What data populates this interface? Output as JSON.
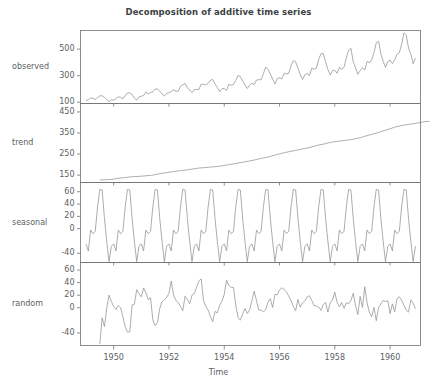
{
  "title": "Decomposition of additive time series",
  "xaxis": {
    "label": "Time",
    "ticks": [
      1950,
      1952,
      1954,
      1956,
      1958,
      1960
    ],
    "range": [
      1948.8,
      1961.1
    ]
  },
  "panels": [
    {
      "name": "observed",
      "label": "observed",
      "yticks": [
        100,
        300,
        500
      ],
      "ylim": [
        90,
        640
      ]
    },
    {
      "name": "trend",
      "label": "trend",
      "yticks": [
        150,
        250,
        350,
        450
      ],
      "ylim": [
        115,
        490
      ]
    },
    {
      "name": "seasonal",
      "label": "seasonal",
      "yticks": [
        -40,
        0,
        20,
        40,
        60
      ],
      "ylim": [
        -55,
        75
      ]
    },
    {
      "name": "random",
      "label": "random",
      "yticks": [
        -40,
        0,
        20,
        40,
        60
      ],
      "ylim": [
        -60,
        72
      ]
    }
  ],
  "chart_data": {
    "type": "line",
    "title": "Decomposition of additive time series",
    "xlabel": "Time",
    "ylabel": "",
    "grid": false,
    "legend": "none",
    "x_start": 1949.0,
    "x_step": 0.0833333,
    "xlim": [
      1948.8,
      1961.1
    ],
    "series": [
      {
        "name": "observed",
        "ylim": [
          90,
          640
        ],
        "yticks": [
          100,
          300,
          500
        ],
        "values": [
          112,
          118,
          132,
          129,
          121,
          135,
          148,
          148,
          136,
          119,
          104,
          118,
          115,
          126,
          141,
          135,
          125,
          149,
          170,
          170,
          158,
          133,
          114,
          140,
          145,
          150,
          178,
          163,
          172,
          178,
          199,
          199,
          184,
          162,
          146,
          166,
          171,
          180,
          193,
          181,
          183,
          218,
          230,
          242,
          209,
          191,
          172,
          194,
          196,
          196,
          236,
          235,
          229,
          243,
          264,
          272,
          237,
          211,
          180,
          201,
          204,
          188,
          235,
          227,
          234,
          264,
          302,
          293,
          259,
          229,
          203,
          229,
          242,
          233,
          267,
          269,
          270,
          315,
          364,
          347,
          312,
          274,
          237,
          278,
          284,
          277,
          317,
          313,
          318,
          374,
          413,
          405,
          355,
          306,
          271,
          306,
          315,
          301,
          356,
          348,
          355,
          422,
          465,
          467,
          404,
          347,
          305,
          336,
          340,
          318,
          362,
          348,
          363,
          435,
          491,
          505,
          404,
          359,
          310,
          337,
          360,
          342,
          406,
          396,
          420,
          472,
          548,
          559,
          463,
          407,
          362,
          405,
          417,
          391,
          419,
          461,
          472,
          535,
          622,
          606,
          508,
          461,
          390,
          432
        ]
      },
      {
        "name": "trend",
        "ylim": [
          115,
          490
        ],
        "yticks": [
          150,
          250,
          350,
          450
        ],
        "x_offset_months": 6,
        "values": [
          126.79,
          127.25,
          127.96,
          128.58,
          129.0,
          129.75,
          131.25,
          133.08,
          134.92,
          136.42,
          137.42,
          138.54,
          139.79,
          141.13,
          142.33,
          143.08,
          143.63,
          144.13,
          145.08,
          145.83,
          146.96,
          148.0,
          148.92,
          150.21,
          152.38,
          154.67,
          156.58,
          158.33,
          160.17,
          161.92,
          163.58,
          165.42,
          167.17,
          168.5,
          169.83,
          171.25,
          172.79,
          173.71,
          175.04,
          176.92,
          178.54,
          180.17,
          182.08,
          183.46,
          184.54,
          185.25,
          186.29,
          187.21,
          188.21,
          189.04,
          190.17,
          191.29,
          192.54,
          194.17,
          196.04,
          197.75,
          199.42,
          201.42,
          203.5,
          205.54,
          207.46,
          209.29,
          211.0,
          213.04,
          215.21,
          217.29,
          219.42,
          221.71,
          224.21,
          226.83,
          229.21,
          231.54,
          233.92,
          236.21,
          238.92,
          242.0,
          245.13,
          248.0,
          250.79,
          253.54,
          256.08,
          258.58,
          261.08,
          263.33,
          265.42,
          267.54,
          269.71,
          272.04,
          274.25,
          276.38,
          278.54,
          281.17,
          284.21,
          287.29,
          290.17,
          292.75,
          295.0,
          297.17,
          299.75,
          302.46,
          305.0,
          307.0,
          308.58,
          310.17,
          311.63,
          312.88,
          314.17,
          315.5,
          317.0,
          318.71,
          320.71,
          322.83,
          324.92,
          327.5,
          330.71,
          334.21,
          337.46,
          340.5,
          343.42,
          346.29,
          349.42,
          352.88,
          356.42,
          359.83,
          363.13,
          366.54,
          370.21,
          373.92,
          377.42,
          380.38,
          383.0,
          385.38,
          387.38,
          389.04,
          390.67,
          392.33,
          394.0,
          395.79,
          397.67,
          399.63,
          401.54,
          403.38,
          404.75,
          405.5
        ]
      },
      {
        "name": "seasonal",
        "ylim": [
          -55,
          75
        ],
        "yticks": [
          -40,
          0,
          20,
          40,
          60
        ],
        "values": [
          -24.75,
          -36.19,
          -2.24,
          -8.03,
          -4.51,
          35.4,
          63.83,
          62.82,
          16.52,
          -20.64,
          -53.59,
          -28.62
        ],
        "repeat": 12,
        "note": "monthly seasonal indices repeated each year Jan-Dec"
      },
      {
        "name": "random",
        "ylim": [
          -60,
          72
        ],
        "yticks": [
          -40,
          0,
          20,
          40,
          60
        ],
        "x_offset_months": 6,
        "values": [
          -57.79,
          -15.89,
          -29.83,
          -0.24,
          20.17,
          9.87,
          1.96,
          -2.57,
          3.52,
          -0.06,
          -14.12,
          -30.53,
          -38.91,
          -37.9,
          4.52,
          5.64,
          28.68,
          22.41,
          17.37,
          31.53,
          23.66,
          12.7,
          16.34,
          -19.15,
          -28.42,
          -23.24,
          -1.1,
          9.58,
          12.77,
          16.37,
          22.96,
          42.48,
          20.2,
          12.11,
          7.97,
          2.26,
          -4.62,
          18.42,
          13.25,
          6.58,
          20.04,
          22.44,
          32.54,
          42.77,
          45.83,
          11.39,
          2.28,
          -3.66,
          -13.83,
          -22.14,
          -5.75,
          -8.16,
          4.04,
          10.21,
          21.2,
          43.87,
          35.41,
          32.38,
          32.51,
          4.09,
          -15.66,
          -19.75,
          -9.36,
          -1.25,
          -9.04,
          -3.75,
          11.41,
          26.42,
          11.34,
          -3.55,
          -3.79,
          -6.3,
          -2.83,
          8.54,
          14.48,
          0.43,
          21.14,
          20.68,
          28.6,
          31.66,
          29.37,
          25.41,
          18.42,
          11.21,
          2.11,
          -4.59,
          13.26,
          0.96,
          7.71,
          11.0,
          17.18,
          19.07,
          11.56,
          3.66,
          2.96,
          1.16,
          -4.09,
          5.03,
          8.36,
          -6.77,
          7.6,
          12.26,
          24.7,
          8.43,
          1.48,
          8.4,
          -0.79,
          7.95,
          6.48,
          11.41,
          22.94,
          3.74,
          -10.83,
          17.95,
          0.47,
          33.56,
          8.0,
          -7.16,
          -14.35,
          0.61,
          -20.53,
          0.34,
          6.58,
          11.7,
          9.82,
          11.17,
          -9.23,
          6.13,
          -6.28,
          14.17,
          17.52,
          11.97,
          4.0,
          -3.59,
          -6.85,
          12.72,
          7.2,
          -1.64
        ]
      }
    ]
  }
}
